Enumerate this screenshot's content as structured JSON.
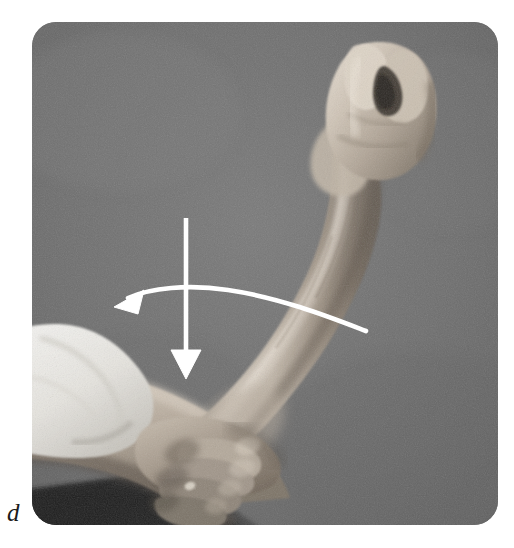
{
  "figure": {
    "panel_label": "d",
    "caption_visible": "",
    "media_type": "photograph",
    "color_mode": "grayscale"
  },
  "photo": {
    "alt": "Clinical photograph: a patient's right forearm held vertically with a clenched fist, supported at the wrist by an examiner's hand; white arrows overlay the image indicating downward force and a leftward arc of movement.",
    "background_color": "#6f6f6f",
    "corner_radius_px": 24,
    "plate": {
      "x": 32,
      "y": 22,
      "width": 466,
      "height": 503
    },
    "subjects": [
      {
        "name": "clenched-fist",
        "label": "Clenched fist"
      },
      {
        "name": "forearm",
        "label": "Forearm"
      },
      {
        "name": "elbow",
        "label": "Elbow"
      },
      {
        "name": "examiner-hand",
        "label": "Examiner's supporting hand"
      },
      {
        "name": "white-sleeve",
        "label": "White sleeve"
      },
      {
        "name": "table-shadow",
        "label": "Table edge shadow"
      }
    ]
  },
  "annotations": {
    "overlay_color": "#ffffff",
    "items": [
      {
        "name": "downward-arrow",
        "type": "straight-arrow",
        "direction": "down",
        "meaning": "Downward resistance applied",
        "start": {
          "x": 186,
          "y": 218
        },
        "end": {
          "x": 186,
          "y": 379
        }
      },
      {
        "name": "curved-arrow",
        "type": "curved-arrow",
        "direction": "left",
        "meaning": "Arc of forearm movement",
        "start": {
          "x": 366,
          "y": 331
        },
        "end": {
          "x": 122,
          "y": 303
        }
      }
    ]
  },
  "colors": {
    "page_background": "#ffffff",
    "photo_background": "#6f6f6f",
    "annotation": "#ffffff",
    "label_text": "#1b1b1b",
    "skin_light": "#d8cfc3",
    "skin_mid": "#a89a8c",
    "skin_dark": "#6e6258",
    "sleeve_white": "#efefec",
    "shadow_dark": "#2a2a2a"
  }
}
